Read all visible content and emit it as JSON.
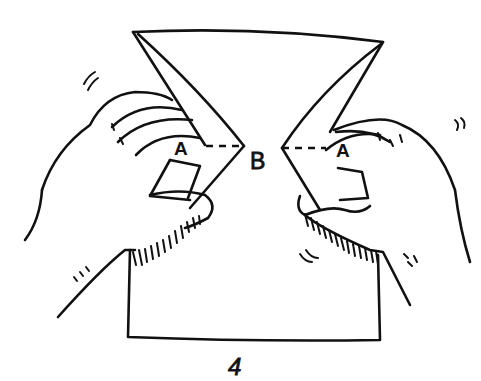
{
  "figure": {
    "type": "origami-instruction-step",
    "labels": {
      "point_a_left": "A",
      "point_b": "B",
      "point_a_right": "A"
    },
    "step_number": "4",
    "elements": [
      "paper-sheet",
      "left-hand",
      "right-hand",
      "fold-line-dashed-left",
      "fold-line-dashed-right",
      "motion-marks"
    ]
  },
  "colors": {
    "ink": "#111111",
    "background": "#ffffff"
  }
}
